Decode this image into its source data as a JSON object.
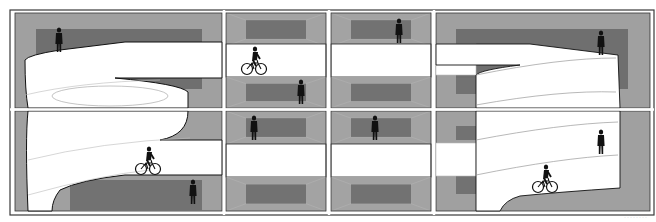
{
  "diagram": {
    "type": "architectural-section",
    "grid": {
      "columns": 4,
      "rows": 2
    },
    "colors": {
      "frame": "#3a3a3a",
      "wall_light": "#9e9e9e",
      "wall_mid": "#8a8a8a",
      "back_panel": "#6e6e6e",
      "ramp": "#ffffff",
      "figure": "#111111"
    },
    "panels": [
      {
        "id": "top-left",
        "content": "spiral ramp with standing person"
      },
      {
        "id": "top-mid-left",
        "content": "floor slab with cyclist and standing person"
      },
      {
        "id": "top-mid-right",
        "content": "floor slab with standing person"
      },
      {
        "id": "top-right",
        "content": "spiral ramp with standing person"
      },
      {
        "id": "bottom-left",
        "content": "spiral ramp with cyclist and standing person"
      },
      {
        "id": "bottom-mid-left",
        "content": "floor slab with standing person"
      },
      {
        "id": "bottom-mid-right",
        "content": "floor slab with standing person"
      },
      {
        "id": "bottom-right",
        "content": "spiral ramp with cyclist and standing person"
      }
    ],
    "figures": {
      "people": 8,
      "cyclists": 3
    },
    "caption": "········"
  }
}
